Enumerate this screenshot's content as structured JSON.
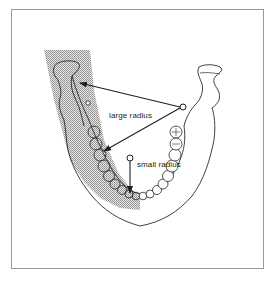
{
  "figure": {
    "labels": {
      "large_radius": "large radius",
      "small_radius": "small radius"
    },
    "colors": {
      "line": "#2a2a2a",
      "frame": "#9a9a9a",
      "shading": "#b8b8b8",
      "background": "#ffffff"
    },
    "annotations": [
      {
        "name": "large-radius",
        "center": [
          182,
          107
        ],
        "arrow_targets": [
          [
            78,
            83
          ],
          [
            103,
            152
          ]
        ]
      },
      {
        "name": "small-radius",
        "center": [
          130,
          158
        ],
        "arrow_targets": [
          [
            130,
            194
          ]
        ]
      }
    ]
  }
}
